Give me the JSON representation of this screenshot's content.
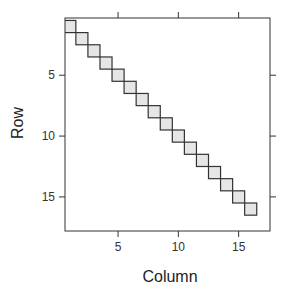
{
  "chart_data": {
    "type": "heatmap",
    "title": "",
    "xlabel": "Column",
    "ylabel": "Row",
    "x_ticks": [
      5,
      10,
      15
    ],
    "y_ticks": [
      5,
      10,
      15
    ],
    "xlim": [
      0.6,
      17.6
    ],
    "ylim": [
      17.8,
      0.3
    ],
    "y_inverted": true,
    "grid": false,
    "legend": "none",
    "cells": [
      {
        "row": 1,
        "col": 1
      },
      {
        "row": 2,
        "col": 2
      },
      {
        "row": 3,
        "col": 3
      },
      {
        "row": 4,
        "col": 4
      },
      {
        "row": 5,
        "col": 5
      },
      {
        "row": 6,
        "col": 6
      },
      {
        "row": 7,
        "col": 7
      },
      {
        "row": 8,
        "col": 8
      },
      {
        "row": 9,
        "col": 9
      },
      {
        "row": 10,
        "col": 10
      },
      {
        "row": 11,
        "col": 11
      },
      {
        "row": 12,
        "col": 12
      },
      {
        "row": 13,
        "col": 13
      },
      {
        "row": 14,
        "col": 14
      },
      {
        "row": 15,
        "col": 15
      },
      {
        "row": 16,
        "col": 16
      }
    ],
    "cell_fill": "#e6e6e6",
    "cell_stroke": "#333333",
    "frame_color": "#333333"
  },
  "labels": {
    "x": "Column",
    "y": "Row"
  }
}
